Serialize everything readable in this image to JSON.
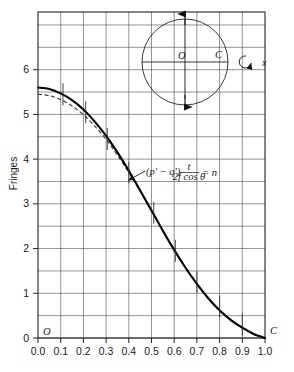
{
  "chart_data": {
    "type": "line",
    "title": "",
    "xlabel": "",
    "ylabel": "Fringes",
    "xlim": [
      0.0,
      1.0
    ],
    "ylim": [
      0.0,
      7.29
    ],
    "grid": true,
    "x_ticks": [
      "0.0",
      "0.1",
      "0.2",
      "0.3",
      "0.4",
      "0.5",
      "0.6",
      "0.7",
      "0.8",
      "0.9",
      "1.0"
    ],
    "x_tick_values": [
      0.0,
      0.1,
      0.2,
      0.3,
      0.4,
      0.5,
      0.6,
      0.7,
      0.8,
      0.9,
      1.0
    ],
    "y_ticks": [
      "0",
      "1",
      "2",
      "3",
      "4",
      "5",
      "6"
    ],
    "y_tick_values": [
      0,
      1,
      2,
      3,
      4,
      5,
      6
    ],
    "y_gridline_values": [
      0.0,
      0.5,
      1.0,
      1.5,
      2.0,
      2.5,
      3.0,
      3.5,
      4.0,
      4.5,
      5.0,
      5.5,
      6.0,
      6.5,
      7.0
    ],
    "x_gridline_values": [
      0.0,
      0.1,
      0.2,
      0.3,
      0.4,
      0.5,
      0.6,
      0.7,
      0.8,
      0.9,
      1.0
    ],
    "legend_position": "none",
    "series": [
      {
        "name": "solid-curve",
        "style": "solid",
        "x": [
          0.0,
          0.05,
          0.1,
          0.15,
          0.2,
          0.25,
          0.3,
          0.35,
          0.4,
          0.45,
          0.5,
          0.55,
          0.6,
          0.65,
          0.7,
          0.75,
          0.8,
          0.85,
          0.9,
          0.95,
          1.0
        ],
        "values": [
          5.6,
          5.57,
          5.47,
          5.32,
          5.11,
          4.84,
          4.52,
          4.15,
          3.74,
          3.3,
          2.85,
          2.4,
          1.97,
          1.57,
          1.21,
          0.89,
          0.62,
          0.4,
          0.23,
          0.09,
          0.0
        ]
      },
      {
        "name": "dashed-curve",
        "style": "dashed",
        "x": [
          0.0,
          0.05,
          0.1,
          0.15,
          0.2,
          0.25,
          0.3,
          0.35,
          0.4,
          0.45,
          0.5,
          0.55,
          0.6,
          0.65,
          0.7,
          0.75,
          0.8,
          0.85,
          0.9,
          0.95,
          1.0
        ],
        "values": [
          5.45,
          5.42,
          5.33,
          5.19,
          4.99,
          4.74,
          4.44,
          4.09,
          3.7,
          3.28,
          2.84,
          2.39,
          1.96,
          1.56,
          1.2,
          0.88,
          0.61,
          0.39,
          0.22,
          0.09,
          0.0
        ]
      }
    ],
    "curve_tick_marks": [
      {
        "x": 0.11,
        "y": 5.45
      },
      {
        "x": 0.21,
        "y": 5.05
      },
      {
        "x": 0.305,
        "y": 4.45
      },
      {
        "x": 0.4,
        "y": 3.7
      },
      {
        "x": 0.51,
        "y": 2.8
      },
      {
        "x": 0.605,
        "y": 1.95
      },
      {
        "x": 0.7,
        "y": 1.25
      },
      {
        "x": 0.8,
        "y": 0.7
      },
      {
        "x": 0.9,
        "y": 0.3
      }
    ],
    "annotations": [
      {
        "name": "formula",
        "text": "(p' − q')",
        "numerator": "t",
        "denominator": "2f cos θ",
        "equals": "= n",
        "arrow_to": {
          "x": 0.4,
          "y": 3.62
        }
      },
      {
        "name": "origin-label",
        "text": "O",
        "x": 0.015,
        "y": 0.18
      },
      {
        "name": "corner-label",
        "text": "C",
        "x": 1.035,
        "y": 0.18
      }
    ]
  },
  "inset": {
    "name": "circle-diagram",
    "center_label": "O",
    "right_label": "C",
    "axis_label": "x",
    "rotation_glyph": "↻",
    "arrow_top": true,
    "arrow_bottom": true
  },
  "axis": {
    "y_title": "Fringes"
  }
}
